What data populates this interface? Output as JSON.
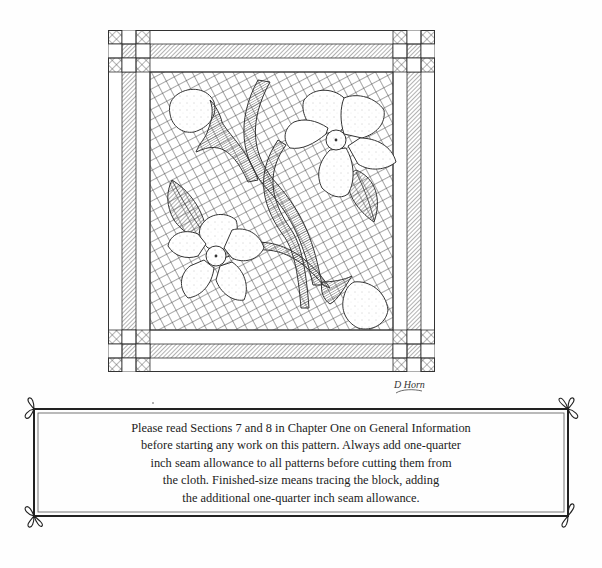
{
  "illustration": {
    "title": "Dogwood quilt block pattern",
    "signature": "D Horn",
    "elements": [
      "corner-squares",
      "border-strips",
      "crosshatch-background",
      "flower-upper-right",
      "flower-lower-left",
      "bud-upper-left",
      "bud-lower-right",
      "stem",
      "leaves"
    ]
  },
  "notice": {
    "lines": [
      "Please read Sections 7 and 8 in Chapter One on General Information",
      "before starting any work on this pattern. Always add one-quarter",
      "inch seam allowance to all patterns before cutting them from",
      "the cloth. Finished-size means tracing the block, adding",
      "the additional one-quarter inch seam allowance."
    ]
  },
  "colors": {
    "ink": "#333333",
    "paper": "#fefefe"
  }
}
